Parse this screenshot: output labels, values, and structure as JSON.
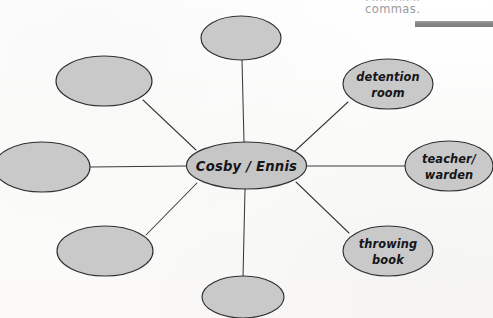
{
  "page": {
    "width": 493,
    "height": 318,
    "background_color": "#fdfdfc",
    "document_type": "handwritten concept map on a printed worksheet"
  },
  "colors": {
    "node_fill": "#c9c9c9",
    "node_stroke": "#2f2f2f",
    "edge_stroke": "#3a3a3a",
    "handwriting_ink": "#15151a",
    "printed_text": "#9a9a9a",
    "rule_bar": "#868686"
  },
  "worksheet_text": {
    "clipped_line_above": "commas,",
    "visible_line": "commas.",
    "rule_bar_label": "gray-rule-bar"
  },
  "diagram": {
    "type": "spider-web concept map",
    "center": {
      "id": "center",
      "label": "Cosby / Ennis",
      "filled": true,
      "cx": 246.5,
      "cy": 165.5,
      "rx": 60,
      "ry": 23.5
    },
    "nodes": [
      {
        "id": "node-top",
        "label": "",
        "filled": false,
        "cx": 241,
        "cy": 38,
        "rx": 40,
        "ry": 22,
        "position": "top",
        "clipped": "top"
      },
      {
        "id": "node-top-left",
        "label": "",
        "filled": false,
        "cx": 104,
        "cy": 81,
        "rx": 48,
        "ry": 25,
        "position": "top-left"
      },
      {
        "id": "node-left",
        "label": "",
        "filled": false,
        "cx": 42,
        "cy": 167,
        "rx": 48,
        "ry": 25,
        "position": "left",
        "clipped": "left"
      },
      {
        "id": "node-bottom-left",
        "label": "",
        "filled": false,
        "cx": 105,
        "cy": 251,
        "rx": 48,
        "ry": 25,
        "position": "bottom-left"
      },
      {
        "id": "node-bottom",
        "label": "",
        "filled": false,
        "cx": 243,
        "cy": 297,
        "rx": 41,
        "ry": 21,
        "position": "bottom",
        "clipped": "bottom"
      },
      {
        "id": "node-detention-room",
        "label_line1": "detention",
        "label_line2": "room",
        "filled": true,
        "cx": 388,
        "cy": 84,
        "rx": 45,
        "ry": 25,
        "position": "top-right"
      },
      {
        "id": "node-teacher-warden",
        "label_line1": "teacher/",
        "label_line2": "warden",
        "filled": true,
        "cx": 449,
        "cy": 166,
        "rx": 44,
        "ry": 25,
        "position": "right",
        "clipped": "right"
      },
      {
        "id": "node-throwing-book",
        "label_line1": "throwing",
        "label_line2": "book",
        "filled": true,
        "cx": 388,
        "cy": 251,
        "rx": 45,
        "ry": 25,
        "position": "bottom-right"
      }
    ],
    "edges": [
      {
        "id": "edge-center-top",
        "from": "center",
        "to": "node-top",
        "x1": 244,
        "y1": 142,
        "x2": 242,
        "y2": 60
      },
      {
        "id": "edge-center-top-left",
        "from": "center",
        "to": "node-top-left",
        "x1": 196,
        "y1": 150,
        "x2": 143,
        "y2": 100
      },
      {
        "id": "edge-center-left",
        "from": "center",
        "to": "node-left",
        "x1": 186,
        "y1": 166,
        "x2": 90,
        "y2": 167
      },
      {
        "id": "edge-center-bottom-left",
        "from": "center",
        "to": "node-bottom-left",
        "x1": 197,
        "y1": 183,
        "x2": 146,
        "y2": 235
      },
      {
        "id": "edge-center-bottom",
        "from": "center",
        "to": "node-bottom",
        "x1": 245,
        "y1": 189,
        "x2": 243,
        "y2": 277
      },
      {
        "id": "edge-center-detention",
        "from": "center",
        "to": "node-detention-room",
        "x1": 295,
        "y1": 151,
        "x2": 348,
        "y2": 102
      },
      {
        "id": "edge-center-teacher",
        "from": "center",
        "to": "node-teacher-warden",
        "x1": 306,
        "y1": 166,
        "x2": 405,
        "y2": 166
      },
      {
        "id": "edge-center-throwing",
        "from": "center",
        "to": "node-throwing-book",
        "x1": 296,
        "y1": 182,
        "x2": 349,
        "y2": 233
      }
    ]
  }
}
